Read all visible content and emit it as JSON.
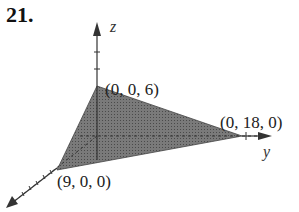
{
  "problem_number": "21.",
  "axes": {
    "x": "x",
    "y": "y",
    "z": "z"
  },
  "vertices": [
    {
      "label": "(0, 0, 6)"
    },
    {
      "label": "(0, 18, 0)"
    },
    {
      "label": "(9, 0, 0)"
    }
  ],
  "colors": {
    "fill": "#6e6e6e",
    "axis": "#333333"
  }
}
